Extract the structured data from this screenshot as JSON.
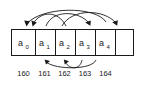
{
  "diagram": {
    "type": "array-permutation-diagram",
    "title": "",
    "colors": {
      "stroke": "#1a1a1a",
      "background": "#ffffff",
      "text": "#1a1a1a"
    },
    "array": {
      "name": "a",
      "cell_count": 5,
      "cells": [
        {
          "label": "a",
          "subscript": "0",
          "index": 0,
          "address": "160"
        },
        {
          "label": "a",
          "subscript": "1",
          "index": 1,
          "address": "161"
        },
        {
          "label": "a",
          "subscript": "2",
          "index": 2,
          "address": "162"
        },
        {
          "label": "a",
          "subscript": "3",
          "index": 3,
          "address": "163"
        },
        {
          "label": "a",
          "subscript": "4",
          "index": 4,
          "address": "164"
        }
      ]
    },
    "addresses": [
      "160",
      "161",
      "162",
      "163",
      "164"
    ],
    "arrows": {
      "above": [
        {
          "from_index": 1,
          "to_index": 0,
          "direction": "down-left"
        },
        {
          "from_index": 4,
          "to_index": 0,
          "direction": "down-left"
        },
        {
          "from_index": 2,
          "to_index": 3,
          "direction": "down-right"
        },
        {
          "from_index": 3,
          "to_index": 4,
          "direction": "down-right"
        }
      ],
      "below": [
        {
          "from_index": 2,
          "to_index": 1,
          "direction": "up-left"
        },
        {
          "from_index": 3,
          "to_index": 2,
          "direction": "up-left"
        }
      ]
    }
  }
}
